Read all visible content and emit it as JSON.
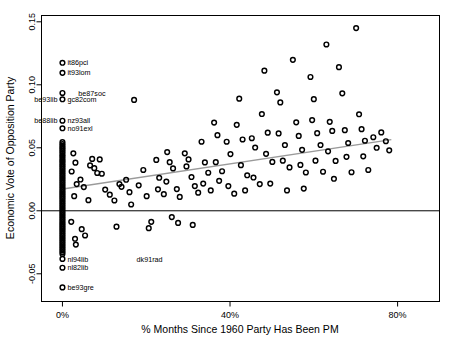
{
  "chart_data": {
    "type": "scatter",
    "title": "",
    "xlabel": "% Months Since 1960 Party Has Been PM",
    "ylabel": "Economic Vote of Opposition Party",
    "xlim": [
      -5,
      90
    ],
    "ylim": [
      -0.072,
      0.155
    ],
    "xticks": [
      0,
      40,
      80
    ],
    "xticklabels": [
      "0%",
      "40%",
      "80%"
    ],
    "yticks": [
      -0.05,
      0.0,
      0.05,
      0.1,
      0.15
    ],
    "yticklabels": [
      "-0.05",
      "0.00",
      "0.05",
      "0.10",
      "0.15"
    ],
    "grid": false,
    "legend": "none",
    "marker": "open-circle",
    "marker_color": "#000000",
    "reference_line": {
      "type": "horizontal",
      "y": 0.0,
      "color": "#000000"
    },
    "fit_line": {
      "type": "linear",
      "color": "#9a9a9a",
      "x0": 0.5,
      "y0": 0.0175,
      "x1": 78.5,
      "y1": 0.0565
    },
    "points": [
      [
        0,
        0.1175
      ],
      [
        0,
        0.1095
      ],
      [
        0,
        0.0935
      ],
      [
        0,
        0.0885
      ],
      [
        0,
        0.0715
      ],
      [
        0,
        0.0655
      ],
      [
        0,
        0.0545
      ],
      [
        0,
        0.053
      ],
      [
        0,
        0.0515
      ],
      [
        0,
        0.05
      ],
      [
        0,
        0.0487
      ],
      [
        0,
        0.0472
      ],
      [
        0,
        0.0458
      ],
      [
        0,
        0.0443
      ],
      [
        0,
        0.043
      ],
      [
        0,
        0.0415
      ],
      [
        0,
        0.04
      ],
      [
        0,
        0.0388
      ],
      [
        0,
        0.0372
      ],
      [
        0,
        0.0358
      ],
      [
        0,
        0.0344
      ],
      [
        0,
        0.033
      ],
      [
        0,
        0.0316
      ],
      [
        0,
        0.0302
      ],
      [
        0,
        0.0288
      ],
      [
        0,
        0.0274
      ],
      [
        0,
        0.026
      ],
      [
        0,
        0.0246
      ],
      [
        0,
        0.0232
      ],
      [
        0,
        0.0218
      ],
      [
        0,
        0.0204
      ],
      [
        0,
        0.019
      ],
      [
        0,
        0.0176
      ],
      [
        0,
        0.0162
      ],
      [
        0,
        0.0148
      ],
      [
        0,
        0.0134
      ],
      [
        0,
        0.012
      ],
      [
        0,
        0.0106
      ],
      [
        0,
        0.0092
      ],
      [
        0,
        0.0078
      ],
      [
        0,
        0.0064
      ],
      [
        0,
        0.005
      ],
      [
        0,
        0.0036
      ],
      [
        0,
        0.0022
      ],
      [
        0,
        0.0008
      ],
      [
        0,
        -0.0006
      ],
      [
        0,
        -0.002
      ],
      [
        0,
        -0.0034
      ],
      [
        0,
        -0.0048
      ],
      [
        0,
        -0.0062
      ],
      [
        0,
        -0.0076
      ],
      [
        0,
        -0.009
      ],
      [
        0,
        -0.0104
      ],
      [
        0,
        -0.0118
      ],
      [
        0,
        -0.0132
      ],
      [
        0,
        -0.0146
      ],
      [
        0,
        -0.016
      ],
      [
        0,
        -0.0174
      ],
      [
        0,
        -0.0188
      ],
      [
        0,
        -0.0202
      ],
      [
        0,
        -0.0216
      ],
      [
        0,
        -0.023
      ],
      [
        0,
        -0.0244
      ],
      [
        0,
        -0.0258
      ],
      [
        0,
        -0.0272
      ],
      [
        0,
        -0.0286
      ],
      [
        0,
        -0.03
      ],
      [
        0,
        -0.0314
      ],
      [
        0,
        -0.0328
      ],
      [
        0,
        -0.0342
      ],
      [
        0,
        -0.0382
      ],
      [
        0,
        -0.0452
      ],
      [
        0,
        -0.0608
      ],
      [
        2.6,
        0.0456
      ],
      [
        3.1,
        0.0382
      ],
      [
        2.2,
        0.0312
      ],
      [
        3.4,
        0.0212
      ],
      [
        2.8,
        0.0116
      ],
      [
        2.1,
        -0.0088
      ],
      [
        3.0,
        -0.0222
      ],
      [
        3.2,
        -0.0268
      ],
      [
        4.3,
        0.0248
      ],
      [
        5.1,
        0.0188
      ],
      [
        4.6,
        -0.0146
      ],
      [
        5.4,
        -0.0196
      ],
      [
        6.2,
        0.0084
      ],
      [
        7.1,
        0.0412
      ],
      [
        6.6,
        0.036
      ],
      [
        7.6,
        0.0338
      ],
      [
        8.3,
        0.03
      ],
      [
        8.9,
        0.0408
      ],
      [
        9.4,
        0.0294
      ],
      [
        10.2,
        0.0168
      ],
      [
        11.3,
        0.0128
      ],
      [
        12.4,
        0.0082
      ],
      [
        13.6,
        0.0212
      ],
      [
        12.9,
        -0.0126
      ],
      [
        14.1,
        0.019
      ],
      [
        15.2,
        0.0246
      ],
      [
        16.0,
        0.0148
      ],
      [
        17.1,
        0.088
      ],
      [
        16.4,
        0.005
      ],
      [
        18.2,
        0.0202
      ],
      [
        19.3,
        0.0324
      ],
      [
        20.1,
        0.0116
      ],
      [
        21.2,
        -0.0088
      ],
      [
        20.6,
        -0.0138
      ],
      [
        22.4,
        0.0404
      ],
      [
        23.1,
        0.0262
      ],
      [
        22.8,
        0.017
      ],
      [
        24.2,
        0.0132
      ],
      [
        25.0,
        0.0466
      ],
      [
        25.6,
        0.0386
      ],
      [
        26.4,
        0.0336
      ],
      [
        24.8,
        0.0232
      ],
      [
        26.1,
        -0.005
      ],
      [
        27.3,
        0.0172
      ],
      [
        28.0,
        0.011
      ],
      [
        27.6,
        -0.0096
      ],
      [
        29.2,
        0.0456
      ],
      [
        30.1,
        0.0408
      ],
      [
        29.6,
        0.0352
      ],
      [
        30.8,
        0.0268
      ],
      [
        31.6,
        0.0196
      ],
      [
        32.4,
        0.0144
      ],
      [
        31.1,
        -0.0112
      ],
      [
        33.2,
        0.0548
      ],
      [
        34.0,
        0.0384
      ],
      [
        34.8,
        0.0302
      ],
      [
        33.6,
        0.0216
      ],
      [
        35.4,
        0.0162
      ],
      [
        36.2,
        0.07
      ],
      [
        37.0,
        0.06
      ],
      [
        36.6,
        0.0386
      ],
      [
        38.1,
        0.0314
      ],
      [
        37.4,
        0.0238
      ],
      [
        39.2,
        0.0548
      ],
      [
        40.1,
        0.045
      ],
      [
        39.6,
        0.0196
      ],
      [
        41.0,
        0.0136
      ],
      [
        42.2,
        0.089
      ],
      [
        41.6,
        0.0682
      ],
      [
        43.0,
        0.0566
      ],
      [
        42.6,
        0.0362
      ],
      [
        44.1,
        0.0282
      ],
      [
        43.6,
        0.0162
      ],
      [
        45.2,
        0.0576
      ],
      [
        46.0,
        0.0502
      ],
      [
        45.6,
        0.0264
      ],
      [
        47.1,
        0.0212
      ],
      [
        48.2,
        0.1112
      ],
      [
        47.6,
        0.0768
      ],
      [
        49.0,
        0.062
      ],
      [
        48.6,
        0.0452
      ],
      [
        50.1,
        0.0388
      ],
      [
        49.6,
        0.0216
      ],
      [
        51.2,
        0.094
      ],
      [
        52.0,
        0.086
      ],
      [
        51.6,
        0.0614
      ],
      [
        53.1,
        0.0522
      ],
      [
        52.6,
        0.0398
      ],
      [
        54.2,
        0.0344
      ],
      [
        53.6,
        0.0162
      ],
      [
        55.0,
        0.1198
      ],
      [
        55.8,
        0.0702
      ],
      [
        56.4,
        0.0594
      ],
      [
        57.2,
        0.0484
      ],
      [
        56.8,
        0.0364
      ],
      [
        58.1,
        0.0304
      ],
      [
        57.6,
        0.0176
      ],
      [
        59.2,
        0.1062
      ],
      [
        60.0,
        0.0886
      ],
      [
        59.6,
        0.072
      ],
      [
        60.8,
        0.0616
      ],
      [
        61.6,
        0.0522
      ],
      [
        60.4,
        0.0398
      ],
      [
        62.2,
        0.031
      ],
      [
        63.0,
        0.132
      ],
      [
        63.8,
        0.0706
      ],
      [
        64.4,
        0.0634
      ],
      [
        63.4,
        0.0472
      ],
      [
        65.2,
        0.0396
      ],
      [
        64.8,
        0.0254
      ],
      [
        66.0,
        0.114
      ],
      [
        66.8,
        0.0932
      ],
      [
        67.4,
        0.064
      ],
      [
        68.2,
        0.0538
      ],
      [
        67.8,
        0.0428
      ],
      [
        69.0,
        0.0306
      ],
      [
        70.1,
        0.145
      ],
      [
        70.8,
        0.0766
      ],
      [
        71.4,
        0.0648
      ],
      [
        72.2,
        0.0556
      ],
      [
        71.8,
        0.0432
      ],
      [
        73.0,
        0.0324
      ],
      [
        74.2,
        0.0584
      ],
      [
        75.0,
        0.05
      ],
      [
        76.1,
        0.0622
      ],
      [
        77.2,
        0.0552
      ],
      [
        78.0,
        0.048
      ]
    ],
    "annotations": [
      {
        "label": "it86pci",
        "x": 0,
        "y": 0.1175,
        "side": "right"
      },
      {
        "label": "it93lom",
        "x": 0,
        "y": 0.1095,
        "side": "right"
      },
      {
        "label": "be87soc",
        "x": 2.6,
        "y": 0.0935,
        "side": "right"
      },
      {
        "label": "gc82com",
        "x": 0,
        "y": 0.0885,
        "side": "right"
      },
      {
        "label": "be93lib",
        "x": 0,
        "y": 0.0885,
        "side": "left"
      },
      {
        "label": "nz93all",
        "x": 0,
        "y": 0.0715,
        "side": "right"
      },
      {
        "label": "be88lib",
        "x": 0,
        "y": 0.0715,
        "side": "left"
      },
      {
        "label": "no91exl",
        "x": 0,
        "y": 0.0655,
        "side": "right"
      },
      {
        "label": "nl94lib",
        "x": 0,
        "y": -0.0382,
        "side": "right"
      },
      {
        "label": "nl82lib",
        "x": 0,
        "y": -0.0452,
        "side": "right"
      },
      {
        "label": "dk91rad",
        "x": 16.5,
        "y": -0.0382,
        "side": "right"
      },
      {
        "label": "be93gre",
        "x": 0,
        "y": -0.0608,
        "side": "right"
      }
    ]
  }
}
